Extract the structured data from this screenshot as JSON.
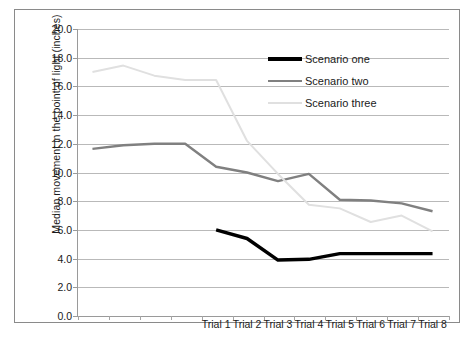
{
  "chart_data": {
    "type": "line",
    "title": "",
    "xlabel": "",
    "ylabel": "Median movement in the point of light (inches)",
    "ylim": [
      0.0,
      20.0
    ],
    "ytick_step": 2.0,
    "ytick_labels": [
      "20.0",
      "18.0",
      "16.0",
      "14.0",
      "12.0",
      "10.0",
      "8.0",
      "6.0",
      "4.0",
      "2.0",
      "0.0"
    ],
    "ytick_values": [
      20.0,
      18.0,
      16.0,
      14.0,
      12.0,
      10.0,
      8.0,
      6.0,
      4.0,
      2.0,
      0.0
    ],
    "grid": true,
    "grid_axis": "y",
    "legend_position": "top-right",
    "category_count": 12,
    "categories": [
      "",
      "",
      "",
      "",
      "Trial 1",
      "Trial 2",
      "Trial 3",
      "Trial 4",
      "Trial 5",
      "Trial 6",
      "Trial 7",
      "Trial 8"
    ],
    "xtick_labels": [
      "Trial 1",
      "Trial 2",
      "Trial 3",
      "Trial 4",
      "Trial 5",
      "Trial 6",
      "Trial 7",
      "Trial 8"
    ],
    "series": [
      {
        "name": "Scenario one",
        "color": "#000000",
        "width": 3.4,
        "values": [
          null,
          null,
          null,
          null,
          6.0,
          5.4,
          3.9,
          3.95,
          4.35,
          4.35,
          4.35,
          4.35
        ]
      },
      {
        "name": "Scenario two",
        "color": "#808080",
        "width": 2.4,
        "values": [
          11.65,
          11.9,
          12.0,
          12.0,
          10.4,
          10.0,
          9.4,
          9.9,
          8.1,
          8.05,
          7.85,
          7.3
        ]
      },
      {
        "name": "Scenario three",
        "color": "#e0e0e0",
        "width": 2.0,
        "values": [
          17.0,
          17.45,
          16.75,
          16.45,
          16.45,
          12.2,
          9.9,
          7.75,
          7.5,
          6.55,
          7.0,
          5.9
        ]
      }
    ]
  },
  "legend": {
    "items": [
      {
        "label": "Scenario one",
        "color": "#000000",
        "width": 3.4
      },
      {
        "label": "Scenario two",
        "color": "#808080",
        "width": 2.4
      },
      {
        "label": "Scenario three",
        "color": "#e0e0e0",
        "width": 2.0
      }
    ]
  }
}
